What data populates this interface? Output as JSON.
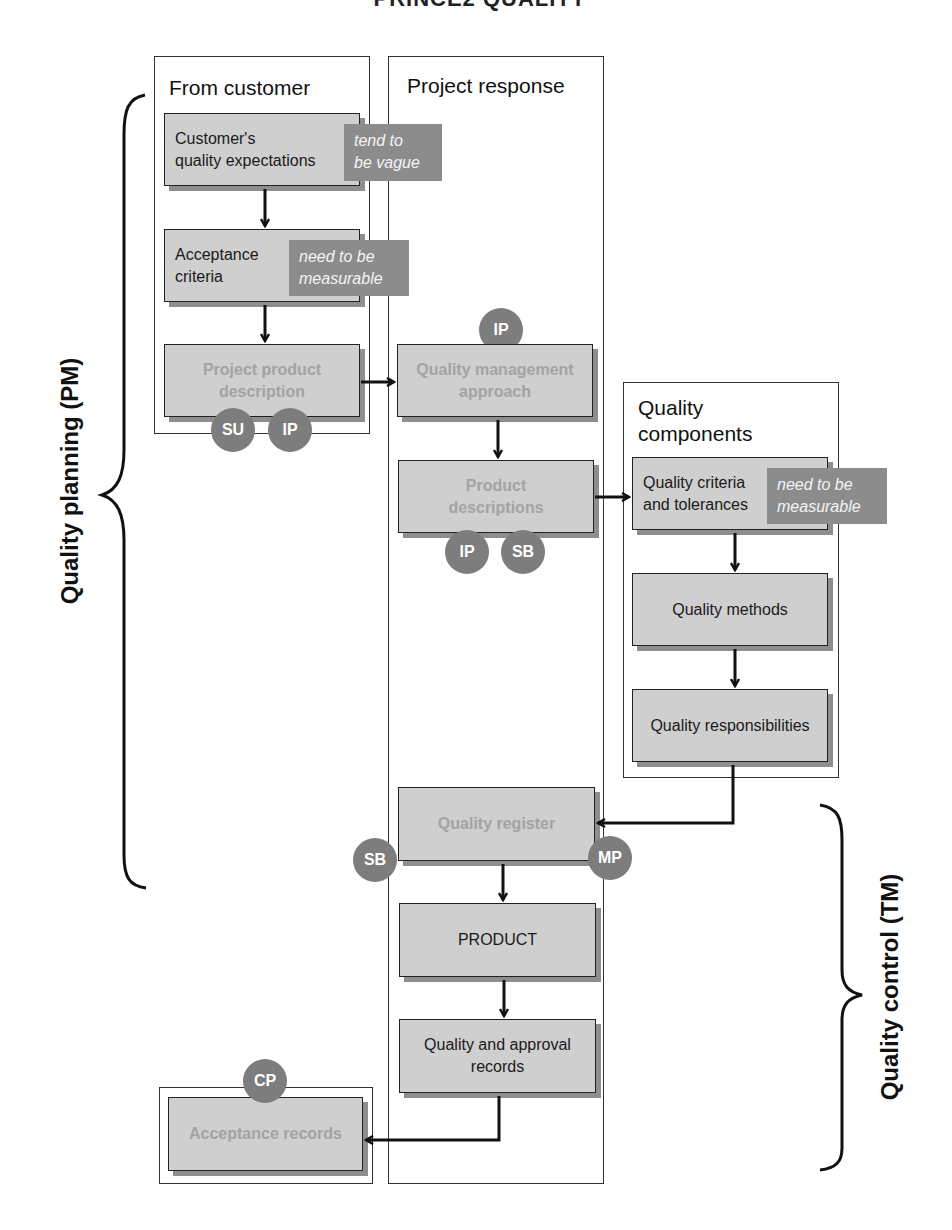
{
  "header": {
    "title_partial": "PRINCE2 QUALITY"
  },
  "lanes": {
    "from_customer": {
      "title": "From customer"
    },
    "project_response": {
      "title": "Project response"
    },
    "quality_components": {
      "title_line1": "Quality",
      "title_line2": "components"
    }
  },
  "nodes": {
    "customer_expectations": {
      "line1": "Customer's",
      "line2": "quality expectations"
    },
    "acceptance_criteria": {
      "line1": "Acceptance",
      "line2": "criteria"
    },
    "project_product_description": {
      "line1": "Project product",
      "line2": "description"
    },
    "quality_management_approach": {
      "line1": "Quality management",
      "line2": "approach"
    },
    "product_descriptions": {
      "line1": "Product",
      "line2": "descriptions"
    },
    "quality_criteria": {
      "line1": "Quality criteria",
      "line2": "and tolerances"
    },
    "quality_methods": {
      "label": "Quality methods"
    },
    "quality_responsibilities": {
      "label": "Quality responsibilities"
    },
    "quality_register": {
      "label": "Quality register"
    },
    "product": {
      "label": "PRODUCT"
    },
    "quality_approval_records": {
      "line1": "Quality and approval",
      "line2": "records"
    },
    "acceptance_records": {
      "label": "Acceptance records"
    }
  },
  "notes": {
    "vague": {
      "line1": "tend to",
      "line2": "be vague"
    },
    "measurable_1": {
      "line1": "need to be",
      "line2": "measurable"
    },
    "measurable_2": {
      "line1": "need to be",
      "line2": "measurable"
    }
  },
  "badges": {
    "ppd_su": "SU",
    "ppd_ip": "IP",
    "qma_ip": "IP",
    "pd_ip": "IP",
    "pd_sb": "SB",
    "qr_sb": "SB",
    "qr_mp": "MP",
    "ar_cp": "CP"
  },
  "side_labels": {
    "planning": "Quality planning (PM)",
    "control": "Quality control (TM)"
  },
  "colors": {
    "node_fill": "#cfcfcf",
    "note_fill": "#8c8c8c",
    "badge_fill": "#7d7d7d",
    "faded_text": "#a3a3a3",
    "line": "#111111"
  }
}
